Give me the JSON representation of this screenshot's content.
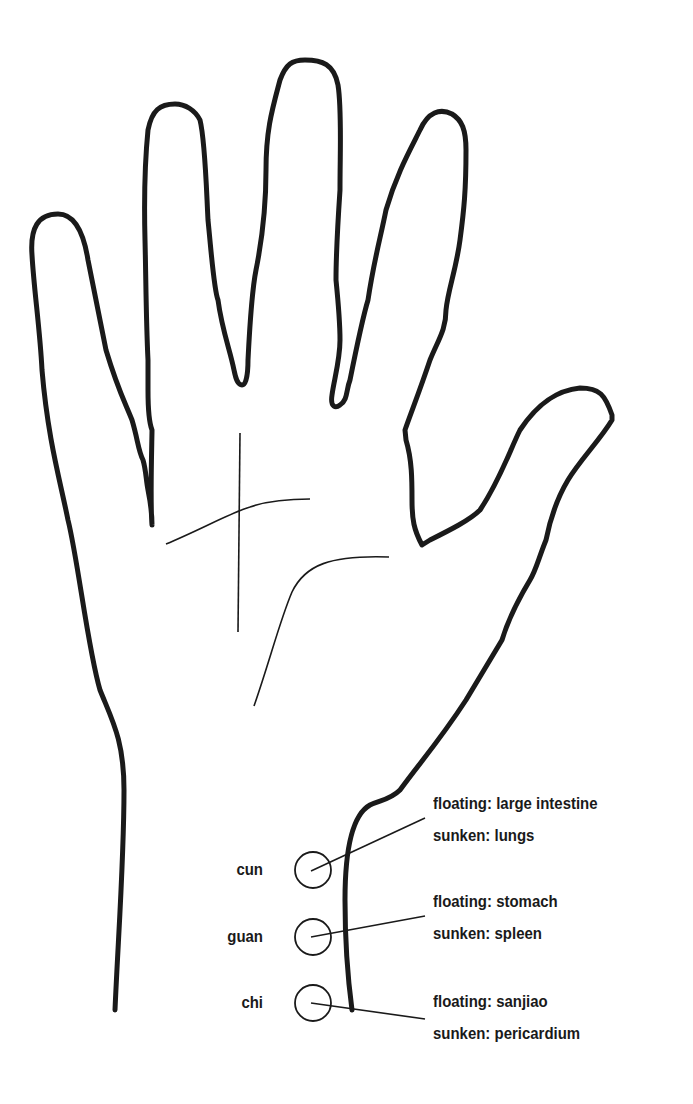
{
  "diagram": {
    "colors": {
      "stroke": "#1a1a1a",
      "background": "#ffffff"
    },
    "pulse_positions": [
      {
        "name": "cun",
        "floating": "floating: large intestine",
        "sunken": "sunken: lungs"
      },
      {
        "name": "guan",
        "floating": "floating: stomach",
        "sunken": "sunken: spleen"
      },
      {
        "name": "chi",
        "floating": "floating: sanjiao",
        "sunken": "sunken: pericardium"
      }
    ]
  }
}
